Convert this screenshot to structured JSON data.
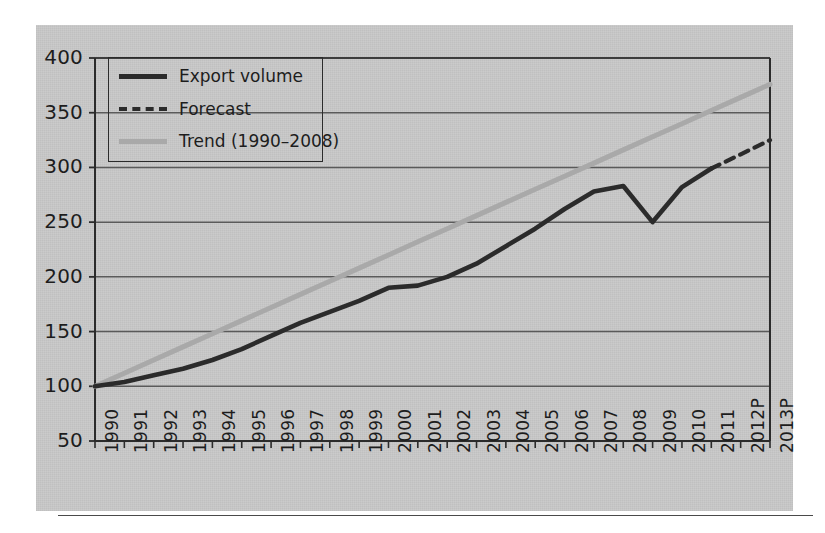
{
  "chart_data": {
    "type": "line",
    "title": "",
    "xlabel": "",
    "ylabel": "",
    "ylim": [
      50,
      400
    ],
    "yticks": [
      50,
      100,
      150,
      200,
      250,
      300,
      350,
      400
    ],
    "grid": true,
    "legend_position": "top-left",
    "categories": [
      "1990",
      "1991",
      "1992",
      "1993",
      "1994",
      "1995",
      "1996",
      "1997",
      "1998",
      "1999",
      "2000",
      "2001",
      "2002",
      "2003",
      "2004",
      "2005",
      "2006",
      "2007",
      "2008",
      "2009",
      "2010",
      "2011",
      "2012P",
      "2013P"
    ],
    "series": [
      {
        "name": "Export volume",
        "style": "solid",
        "color": "#2b2b2b",
        "values": [
          100,
          104,
          110,
          116,
          124,
          134,
          146,
          158,
          168,
          178,
          190,
          192,
          200,
          212,
          228,
          244,
          262,
          278,
          283,
          250,
          282,
          299,
          null,
          null
        ]
      },
      {
        "name": "Forecast",
        "style": "dashed",
        "color": "#2b2b2b",
        "values": [
          null,
          null,
          null,
          null,
          null,
          null,
          null,
          null,
          null,
          null,
          null,
          null,
          null,
          null,
          null,
          null,
          null,
          null,
          null,
          null,
          null,
          299,
          312,
          325
        ]
      },
      {
        "name": "Trend (1990–2008)",
        "style": "solid",
        "color": "#a9a9a9",
        "values": [
          100,
          112,
          124,
          136,
          148,
          160,
          172,
          184,
          196,
          208,
          220,
          232,
          244,
          256,
          268,
          280,
          292,
          304,
          316,
          328,
          340,
          352,
          364,
          376
        ]
      }
    ]
  },
  "legend": {
    "items": [
      {
        "label": "Export volume"
      },
      {
        "label": "Forecast"
      },
      {
        "label": "Trend (1990–2008)"
      }
    ]
  },
  "axes": {
    "y_tick_labels": [
      "400",
      "350",
      "300",
      "250",
      "200",
      "150",
      "100",
      "50"
    ],
    "x_tick_labels": [
      "1990",
      "1991",
      "1992",
      "1993",
      "1994",
      "1995",
      "1996",
      "1997",
      "1998",
      "1999",
      "2000",
      "2001",
      "2002",
      "2003",
      "2004",
      "2005",
      "2006",
      "2007",
      "2008",
      "2009",
      "2010",
      "2011",
      "2012P",
      "2013P"
    ]
  },
  "colors": {
    "panel_background": "#c9c9c9",
    "axis": "#2b2b2b",
    "gridline": "#5a5a5a",
    "export_volume": "#2b2b2b",
    "trend": "#a9a9a9"
  }
}
